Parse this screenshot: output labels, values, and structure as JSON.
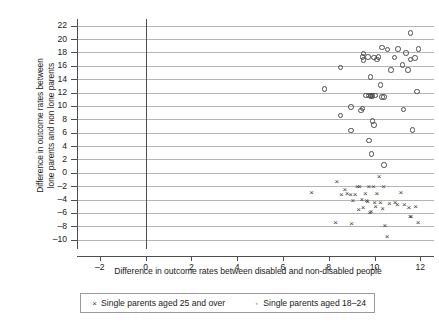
{
  "chart_data": {
    "type": "scatter",
    "title": "",
    "xlabel": "Difference in outcome rates between disabled and non-disabled people",
    "ylabel": "Difference in outcome rates between\nlone parents and non lone parents",
    "xlim": [
      -3,
      12.6
    ],
    "ylim": [
      -11.4,
      23
    ],
    "xticks": [
      -2,
      0,
      2,
      4,
      6,
      8,
      10,
      12
    ],
    "xticklabels": [
      "–2",
      "0",
      "2",
      "4",
      "6",
      "8",
      "10",
      "12"
    ],
    "yticks": [
      -10,
      -8,
      -6,
      -4,
      -2,
      0,
      2,
      4,
      6,
      8,
      10,
      12,
      14,
      16,
      18,
      20,
      22
    ],
    "yticklabels": [
      "–10",
      "–8",
      "–6",
      "–4",
      "–2",
      "0",
      "2",
      "4",
      "6",
      "8",
      "10",
      "12",
      "14",
      "16",
      "18",
      "20",
      "22"
    ],
    "grid": "horizontal",
    "legend_position": "below-axes",
    "vertical_reference_line_x": 0,
    "series": [
      {
        "name": "Single parents aged 25 and over",
        "marker": "x",
        "color": "#3a3a3a",
        "points": [
          [
            7.25,
            -3.1
          ],
          [
            8.35,
            -1.4
          ],
          [
            9.05,
            -4.3
          ],
          [
            9.15,
            -3.4
          ],
          [
            9.25,
            -2.1
          ],
          [
            9.35,
            -2.1
          ],
          [
            9.45,
            -4.1
          ],
          [
            9.5,
            -5.3
          ],
          [
            9.6,
            -3.2
          ],
          [
            9.65,
            -4.3
          ],
          [
            9.7,
            -4.4
          ],
          [
            9.75,
            -2.2
          ],
          [
            9.8,
            -6.0
          ],
          [
            8.95,
            -3.4
          ],
          [
            8.8,
            -3.2
          ],
          [
            8.7,
            -2.6
          ],
          [
            8.55,
            -3.3
          ],
          [
            9.95,
            -2.2
          ],
          [
            10.0,
            -4.5
          ],
          [
            10.05,
            -5.1
          ],
          [
            10.1,
            -3.2
          ],
          [
            10.2,
            -0.6
          ],
          [
            10.25,
            -4.6
          ],
          [
            10.35,
            -5.4
          ],
          [
            10.4,
            -2.2
          ],
          [
            10.45,
            -8.0
          ],
          [
            10.55,
            -9.6
          ],
          [
            10.65,
            -4.7
          ],
          [
            10.9,
            -4.6
          ],
          [
            11.0,
            -4.8
          ],
          [
            11.15,
            -3.0
          ],
          [
            11.3,
            -4.9
          ],
          [
            11.5,
            -5.3
          ],
          [
            11.55,
            -6.7
          ],
          [
            11.6,
            -6.6
          ],
          [
            11.8,
            -5.2
          ],
          [
            11.9,
            -7.6
          ],
          [
            9.0,
            -7.7
          ],
          [
            8.3,
            -7.6
          ],
          [
            9.85,
            -5.9
          ],
          [
            9.3,
            -5.6
          ]
        ]
      },
      {
        "name": "Single parents aged 18–24",
        "marker": "o",
        "color": "#4a4a4a",
        "points": [
          [
            11.55,
            21.0
          ],
          [
            11.9,
            18.6
          ],
          [
            11.0,
            18.6
          ],
          [
            11.35,
            18.0
          ],
          [
            11.55,
            17.0
          ],
          [
            11.75,
            17.2
          ],
          [
            10.55,
            18.5
          ],
          [
            10.3,
            18.8
          ],
          [
            10.85,
            17.3
          ],
          [
            9.45,
            17.4
          ],
          [
            9.5,
            17.9
          ],
          [
            9.5,
            16.9
          ],
          [
            9.7,
            17.4
          ],
          [
            9.95,
            17.3
          ],
          [
            10.15,
            17.4
          ],
          [
            10.1,
            17.0
          ],
          [
            11.2,
            16.2
          ],
          [
            11.45,
            15.4
          ],
          [
            10.7,
            15.4
          ],
          [
            8.5,
            15.8
          ],
          [
            9.8,
            14.4
          ],
          [
            7.8,
            12.6
          ],
          [
            11.85,
            12.2
          ],
          [
            10.25,
            13.2
          ],
          [
            9.75,
            11.6
          ],
          [
            9.8,
            11.5
          ],
          [
            9.85,
            11.6
          ],
          [
            9.9,
            11.5
          ],
          [
            10.0,
            11.6
          ],
          [
            10.3,
            11.4
          ],
          [
            10.4,
            11.4
          ],
          [
            9.6,
            11.6
          ],
          [
            8.95,
            9.9
          ],
          [
            9.4,
            9.4
          ],
          [
            9.45,
            9.7
          ],
          [
            11.25,
            9.5
          ],
          [
            8.5,
            8.6
          ],
          [
            9.9,
            7.8
          ],
          [
            9.95,
            7.2
          ],
          [
            11.65,
            6.5
          ],
          [
            8.95,
            6.4
          ],
          [
            9.75,
            4.9
          ],
          [
            9.85,
            2.9
          ],
          [
            10.4,
            1.2
          ]
        ]
      }
    ]
  },
  "legend": {
    "entries": [
      {
        "key": "×",
        "label": "Single parents aged 25 and over"
      },
      {
        "key": "◦",
        "label": "Single parents aged 18–24"
      }
    ]
  }
}
